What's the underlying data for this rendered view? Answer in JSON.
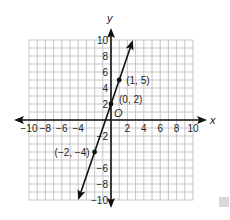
{
  "chart_data": {
    "type": "line",
    "title": "",
    "xlabel": "x",
    "ylabel": "y",
    "xlim": [
      -10,
      10
    ],
    "ylim": [
      -10,
      10
    ],
    "grid": true,
    "grid_step": 1,
    "origin_label": "O",
    "x_tick_labels": [
      "−10",
      "−8",
      "−6",
      "−4",
      "2",
      "4",
      "6",
      "8",
      "10"
    ],
    "x_tick_values": [
      -10,
      -8,
      -6,
      -4,
      2,
      4,
      6,
      8,
      10
    ],
    "y_tick_labels": [
      "10",
      "8",
      "6",
      "4",
      "2",
      "−2",
      "−6",
      "−8",
      "−10"
    ],
    "y_tick_values": [
      10,
      8,
      6,
      4,
      2,
      -2,
      -6,
      -8,
      -10
    ],
    "series": [
      {
        "name": "y = 3x + 2",
        "slope": 3,
        "intercept": 2,
        "line_endpoints": [
          [
            -4,
            -10
          ],
          [
            2.67,
            10
          ]
        ],
        "points": [
          {
            "x": -2,
            "y": -4,
            "label": "(−2, −4)"
          },
          {
            "x": 0,
            "y": 2,
            "label": "(0, 2)"
          },
          {
            "x": 1,
            "y": 5,
            "label": "(1, 5)"
          }
        ]
      }
    ],
    "colors": {
      "grid": "#b8b8b8",
      "axes": "#111111",
      "line": "#111111"
    }
  }
}
